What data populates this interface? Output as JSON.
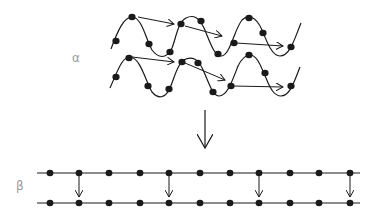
{
  "labels": {
    "alpha": "α",
    "beta": "β"
  },
  "colors": {
    "ink": "#1a1a1a",
    "label": "#9a9a9a"
  },
  "alpha_helix": {
    "strands": [
      {
        "name": "helix-strand-1",
        "path": "M111,49 C118,30 124,17 132,17 C142,17 146,40 152,50 C158,58 166,60 172,48 C176,38 178,22 186,18 C194,14 199,18 204,28 C210,42 214,56 221,56 C230,56 234,30 242,20 C248,14 256,16 262,30 C267,42 272,56 280,56 C290,56 294,40 301,23",
        "dots": [
          [
            116,
            41
          ],
          [
            132,
            17
          ],
          [
            149,
            44
          ],
          [
            170,
            52
          ],
          [
            181,
            24
          ],
          [
            201,
            21
          ],
          [
            218,
            54
          ],
          [
            234,
            43
          ],
          [
            249,
            18
          ],
          [
            263,
            33
          ],
          [
            291,
            47
          ]
        ],
        "arrows": [
          [
            [
              138,
              17
            ],
            [
              174,
              24
            ]
          ],
          [
            [
              185,
              26
            ],
            [
              222,
              36
            ]
          ],
          [
            [
              236,
              43
            ],
            [
              283,
              46
            ]
          ]
        ]
      },
      {
        "name": "helix-strand-2",
        "path": "M110,88 C118,70 122,57 130,57 C140,57 146,82 152,92 C158,99 165,99 170,88 C175,76 178,62 186,59 C194,56 199,60 204,72 C210,86 213,96 219,96 C227,96 232,82 238,66 C242,58 246,55 250,55 C258,55 262,70 266,78 C270,88 274,96 281,96 C290,96 294,82 300,67",
        "dots": [
          [
            116,
            77
          ],
          [
            129,
            58
          ],
          [
            148,
            86
          ],
          [
            169,
            89
          ],
          [
            182,
            62
          ],
          [
            198,
            63
          ],
          [
            213,
            92
          ],
          [
            231,
            86
          ],
          [
            249,
            55
          ],
          [
            265,
            73
          ],
          [
            291,
            86
          ]
        ],
        "arrows": [
          [
            [
              132,
              57
            ],
            [
              174,
              62
            ]
          ],
          [
            [
              185,
              63
            ],
            [
              225,
              80
            ]
          ],
          [
            [
              233,
              86
            ],
            [
              283,
              87
            ]
          ]
        ]
      }
    ]
  },
  "transition_arrow": {
    "x": 205,
    "y1": 110,
    "y2": 148
  },
  "beta_sheet": {
    "lines": [
      {
        "y": 173,
        "x1": 37,
        "x2": 360
      },
      {
        "y": 203,
        "x1": 37,
        "x2": 360
      }
    ],
    "dot_x": [
      50,
      79,
      109,
      140,
      169,
      200,
      230,
      259,
      290,
      319,
      350
    ],
    "bond_x": [
      79,
      169,
      259,
      350
    ]
  }
}
